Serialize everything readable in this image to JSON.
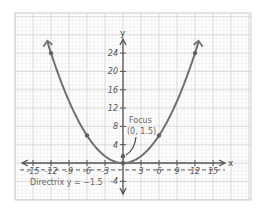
{
  "chart_data": {
    "type": "line",
    "title": "",
    "xlabel": "x",
    "ylabel": "y",
    "xlim": [
      -18,
      19
    ],
    "ylim": [
      -6,
      26
    ],
    "x_ticks": [
      -15,
      -12,
      -9,
      -6,
      -3,
      3,
      6,
      9,
      12,
      15
    ],
    "y_ticks": [
      4,
      8,
      12,
      16,
      20,
      24,
      -4
    ],
    "x_tick_labels": [
      "-15",
      "-12",
      "-9",
      "-6",
      "-3",
      "3",
      "6",
      "9",
      "12",
      "15"
    ],
    "y_tick_labels": [
      "4",
      "8",
      "12",
      "16",
      "20",
      "24",
      "-4"
    ],
    "grid": true,
    "series": [
      {
        "name": "Parabola x^2 = 6y",
        "equation": "y = x^2 / 6",
        "x": [
          -12,
          -6,
          0,
          6,
          12
        ],
        "values": [
          24,
          6,
          0,
          6,
          24
        ],
        "color": "#707070"
      }
    ],
    "points": [
      {
        "label": "",
        "x": -12,
        "y": 24
      },
      {
        "label": "",
        "x": -6,
        "y": 6
      },
      {
        "label": "",
        "x": 0,
        "y": 0
      },
      {
        "label": "Focus",
        "x": 0,
        "y": 1.5
      },
      {
        "label": "",
        "x": 6,
        "y": 6
      },
      {
        "label": "",
        "x": 12,
        "y": 24
      }
    ],
    "directrix": {
      "y": -1.5,
      "style": "dashed"
    },
    "annotations": [
      {
        "text": "Focus",
        "x": 0,
        "y": 1.5
      },
      {
        "text": "(0, 1.5)",
        "x": 0,
        "y": 1.5
      },
      {
        "text": "Directrix y = -1.5",
        "x": -15,
        "y": -4
      }
    ],
    "legend": null
  },
  "labels": {
    "x_axis": "x",
    "y_axis": "y",
    "focus_title": "Focus",
    "focus_coords": "(0, 1.5)",
    "directrix": "Directrix y = −1.5"
  },
  "colors": {
    "curve": "#707070",
    "axis": "#555555",
    "grid_major": "#d4d4d4",
    "grid_minor": "#ececec",
    "frame": "#cfcfcf",
    "point": "#606060"
  }
}
